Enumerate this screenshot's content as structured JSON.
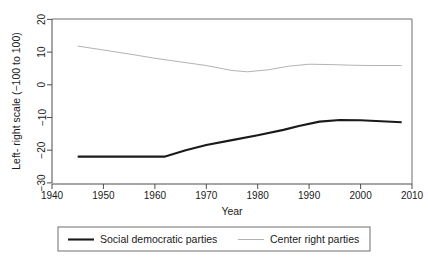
{
  "chart_data": {
    "type": "line",
    "title": "",
    "xlabel": "Year",
    "ylabel": "Left- right scale (−100 to 100)",
    "xlim": [
      1940,
      2010
    ],
    "ylim": [
      -30,
      20
    ],
    "xticks": [
      1940,
      1950,
      1960,
      1970,
      1980,
      1990,
      2000,
      2010
    ],
    "yticks": [
      20,
      10,
      0,
      -10,
      -20,
      -30
    ],
    "xtick_labels": [
      "1940",
      "1950",
      "1960",
      "1970",
      "1980",
      "1990",
      "2000",
      "2010"
    ],
    "ytick_labels": [
      "20",
      "10",
      "0",
      "−10",
      "−20",
      "−30"
    ],
    "grid": false,
    "legend_position": "below",
    "series": [
      {
        "name": "Social democratic parties",
        "color": "#1a1a1a",
        "width": 2.1,
        "x": [
          1945,
          1950,
          1955,
          1962,
          1966,
          1970,
          1975,
          1980,
          1985,
          1988,
          1992,
          1996,
          2000,
          2004,
          2008
        ],
        "values": [
          -21.7,
          -21.7,
          -21.7,
          -21.7,
          -19.8,
          -18.2,
          -16.7,
          -15.2,
          -13.6,
          -12.4,
          -11.1,
          -10.6,
          -10.7,
          -11.0,
          -11.3
        ]
      },
      {
        "name": "Center right parties",
        "color": "#b3b3b3",
        "width": 1.0,
        "x": [
          1945,
          1950,
          1955,
          1960,
          1965,
          1970,
          1975,
          1978,
          1982,
          1986,
          1990,
          1994,
          1998,
          2002,
          2008
        ],
        "values": [
          11.8,
          10.6,
          9.4,
          8.1,
          7.0,
          5.9,
          4.4,
          4.0,
          4.6,
          5.7,
          6.3,
          6.2,
          6.0,
          5.9,
          5.9
        ]
      }
    ]
  },
  "legend": {
    "entries": [
      {
        "label": "Social democratic parties"
      },
      {
        "label": "Center right parties"
      }
    ]
  }
}
